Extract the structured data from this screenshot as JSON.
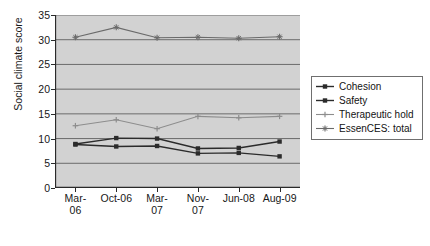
{
  "chart_data": {
    "type": "line",
    "title": "",
    "xlabel": "",
    "ylabel": "Social climate score",
    "categories": [
      "Mar-06",
      "Oct-06",
      "Mar-07",
      "Nov-07",
      "Jun-08",
      "Aug-09"
    ],
    "category_lines": [
      [
        "Mar-",
        "06"
      ],
      [
        "Oct-06",
        ""
      ],
      [
        "Mar-",
        "07"
      ],
      [
        "Nov-",
        "07"
      ],
      [
        "Jun-08",
        ""
      ],
      [
        "Aug-09",
        ""
      ]
    ],
    "ylim": [
      0,
      35
    ],
    "yticks": [
      0,
      5,
      10,
      15,
      20,
      25,
      30,
      35
    ],
    "grid": true,
    "legend_position": "right",
    "series": [
      {
        "name": "Cohesion",
        "values": [
          8.9,
          10.1,
          10.0,
          8.0,
          8.1,
          9.4
        ],
        "color": "#2b2b2b",
        "marker": "square"
      },
      {
        "name": "Safety",
        "values": [
          8.8,
          8.4,
          8.5,
          7.0,
          7.1,
          6.4
        ],
        "color": "#2b2b2b",
        "marker": "square"
      },
      {
        "name": "Therapeutic hold",
        "values": [
          12.6,
          13.8,
          12.0,
          14.5,
          14.2,
          14.5
        ],
        "color": "#8d8d8d",
        "marker": "plus"
      },
      {
        "name": "EssenCES: total",
        "values": [
          30.5,
          32.5,
          30.4,
          30.5,
          30.3,
          30.6
        ],
        "color": "#6a6a6a",
        "marker": "star"
      }
    ]
  },
  "colors": {
    "plot_background": "#d2d2d2",
    "gridline": "#6b6b6b",
    "axis": "#2b2b2b",
    "page_background": "#ffffff"
  }
}
